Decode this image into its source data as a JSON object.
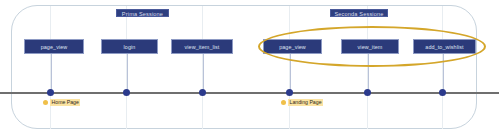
{
  "diagram": {
    "sessions": [
      {
        "label": "Prima Sessione",
        "left": 116,
        "top": 9,
        "width": 53
      },
      {
        "label": "Seconda Sessione",
        "left": 330,
        "top": 9,
        "width": 58
      }
    ],
    "events": [
      {
        "label": "page_view",
        "left": 24,
        "top": 39,
        "width": 60,
        "dot_x": 50.5
      },
      {
        "label": "login",
        "left": 101,
        "top": 39,
        "width": 57,
        "dot_x": 126.5
      },
      {
        "label": "view_item_list",
        "left": 171,
        "top": 39,
        "width": 62,
        "dot_x": 202.5
      },
      {
        "label": "page_view",
        "left": 263,
        "top": 39,
        "width": 59,
        "dot_x": 289.5
      },
      {
        "label": "view_item",
        "left": 341,
        "top": 39,
        "width": 58,
        "dot_x": 367.5
      },
      {
        "label": "add_to_wishlist",
        "left": 413,
        "top": 39,
        "width": 63,
        "dot_x": 442.5
      }
    ],
    "page_markers": [
      {
        "label": "Home Page",
        "left": 43
      },
      {
        "label": "Landing Page",
        "left": 281
      }
    ],
    "gridlines_x": [
      50,
      126,
      202,
      289,
      367,
      442
    ],
    "colors": {
      "event_box_fill": "#2b3a7a",
      "session_pill_fill": "#2e3f80",
      "timeline": "#6f6f6f",
      "dot": "#2b3a8c",
      "highlight_ellipse": "#d4a62a",
      "page_label_fill": "#fbe3a2",
      "frame_border": "#c7d3dd"
    }
  }
}
